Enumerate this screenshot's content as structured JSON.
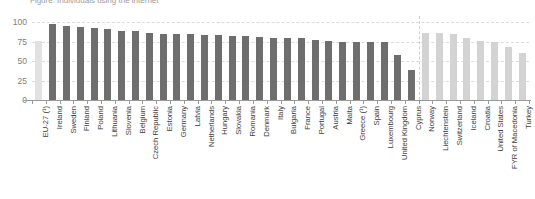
{
  "chart": {
    "title": "Figure: Individuals using the internet",
    "ylabel": "",
    "xlabel": ""
  },
  "chart_data": {
    "type": "bar",
    "title": "Figure: Individuals using the internet",
    "xlabel": "",
    "ylabel": "",
    "ylim": [
      0,
      100
    ],
    "yticks": [
      0,
      25,
      50,
      75,
      100
    ],
    "grid": true,
    "legend": "none",
    "categories": [
      "EU-27 (¹)",
      "Ireland",
      "Sweden",
      "Finland",
      "Poland",
      "Lithuania",
      "Slovenia",
      "Belgium",
      "Czech Republic",
      "Estonia",
      "Germany",
      "Latvia",
      "Netherlands",
      "Hungary",
      "Slovakia",
      "Romania",
      "Denmark",
      "Italy",
      "Bulgaria",
      "France",
      "Portugal",
      "Austria",
      "Malta",
      "Greece (¹)",
      "Spain",
      "Luxembourg",
      "United Kingdom",
      "Cyprus",
      "Norway",
      "Liechtenstein",
      "Switzerland",
      "Iceland",
      "Croatia",
      "United States",
      "FYR of Macedonia",
      "Turkey"
    ],
    "values": [
      76,
      97,
      95,
      93,
      92,
      91,
      89,
      88,
      86,
      85,
      85,
      84,
      83,
      83,
      82,
      82,
      81,
      80,
      80,
      79,
      77,
      76,
      75,
      74,
      74,
      74,
      58,
      38,
      86,
      86,
      85,
      80,
      76,
      75,
      68,
      60
    ],
    "series_groups": [
      {
        "name": "EU aggregate",
        "indices": [
          0
        ],
        "color": "#e2e2e2"
      },
      {
        "name": "EU Member States",
        "indices": [
          1,
          2,
          3,
          4,
          5,
          6,
          7,
          8,
          9,
          10,
          11,
          12,
          13,
          14,
          15,
          16,
          17,
          18,
          19,
          20,
          21,
          22,
          23,
          24,
          25,
          26,
          27
        ],
        "color": "#6e6e6e"
      },
      {
        "name": "Non-EU countries",
        "indices": [
          28,
          29,
          30,
          31,
          32,
          33,
          34,
          35
        ],
        "color": "#d3d3d3"
      }
    ],
    "divider_after_category": "Cyprus"
  }
}
